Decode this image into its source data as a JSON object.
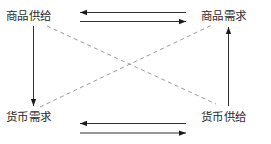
{
  "diagram": {
    "type": "economic-flow-diagram",
    "background_color": "#ffffff",
    "line_color": "#1a1a1a",
    "dashed_line_color": "#8a8a8a",
    "text_color": "#2b2b2b",
    "nodes": [
      {
        "id": "top-left",
        "label": "商品供给"
      },
      {
        "id": "top-right",
        "label": "商品需求"
      },
      {
        "id": "bottom-left",
        "label": "货币需求"
      },
      {
        "id": "bottom-right",
        "label": "货币供给"
      }
    ],
    "connectors": [
      {
        "id": "top-upper",
        "style": "solid",
        "direction": "left",
        "from": "top-right",
        "to": "top-left"
      },
      {
        "id": "top-lower",
        "style": "solid",
        "direction": "right",
        "from": "top-left",
        "to": "top-right"
      },
      {
        "id": "bottom-upper",
        "style": "solid",
        "direction": "left",
        "from": "bottom-right",
        "to": "bottom-left"
      },
      {
        "id": "bottom-lower",
        "style": "solid",
        "direction": "right",
        "from": "bottom-left",
        "to": "bottom-right"
      },
      {
        "id": "left-vertical",
        "style": "solid",
        "direction": "down",
        "from": "top-left",
        "to": "bottom-left"
      },
      {
        "id": "right-vertical",
        "style": "solid",
        "direction": "up",
        "from": "bottom-right",
        "to": "top-right"
      },
      {
        "id": "diagonal-tl-br",
        "style": "dashed",
        "direction": "none",
        "from": "top-left",
        "to": "bottom-right"
      },
      {
        "id": "diagonal-bl-tr",
        "style": "dashed",
        "direction": "none",
        "from": "bottom-left",
        "to": "top-right"
      }
    ]
  }
}
